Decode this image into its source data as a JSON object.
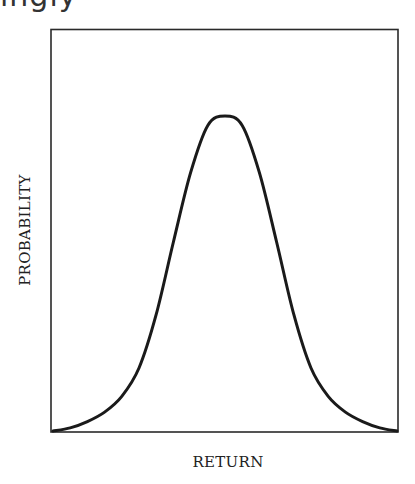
{
  "page": {
    "top_fragment_text": "ingly"
  },
  "chart_data": {
    "type": "line",
    "title": "",
    "xlabel": "RETURN",
    "ylabel": "PROBABILITY",
    "grid": false,
    "legend": null,
    "ticks": {
      "x": [],
      "y": []
    },
    "x": [
      0,
      0.05,
      0.1,
      0.15,
      0.2,
      0.25,
      0.3,
      0.35,
      0.4,
      0.45,
      0.5,
      0.55,
      0.6,
      0.65,
      0.7,
      0.75,
      0.8,
      0.85,
      0.9,
      0.95,
      1.0
    ],
    "values": [
      0.0,
      0.01,
      0.03,
      0.06,
      0.11,
      0.2,
      0.37,
      0.6,
      0.82,
      0.97,
      1.0,
      0.97,
      0.82,
      0.6,
      0.37,
      0.2,
      0.11,
      0.06,
      0.03,
      0.01,
      0.0
    ],
    "xlim": [
      0,
      1
    ],
    "ylim": [
      0,
      1.03
    ],
    "line_color": "#1a1a1a"
  }
}
